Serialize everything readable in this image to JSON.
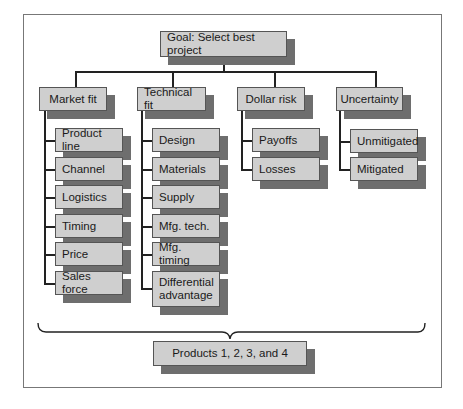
{
  "diagram": {
    "goal": "Goal: Select best project",
    "criteria": [
      {
        "label": "Market fit",
        "children": [
          "Product line",
          "Channel",
          "Logistics",
          "Timing",
          "Price",
          "Sales force"
        ]
      },
      {
        "label": "Technical fit",
        "children": [
          "Design",
          "Materials",
          "Supply",
          "Mfg. tech.",
          "Mfg. timing",
          "Differential advantage"
        ]
      },
      {
        "label": "Dollar risk",
        "children": [
          "Payoffs",
          "Losses"
        ]
      },
      {
        "label": "Uncertainty",
        "children": [
          "Unmitigated",
          "Mitigated"
        ]
      }
    ],
    "alternatives": "Products 1, 2, 3, and 4"
  },
  "colors": {
    "box_fill": "#cfcfcf",
    "shadow": "#6e6e6e",
    "line": "#222222",
    "frame": "#777777"
  }
}
